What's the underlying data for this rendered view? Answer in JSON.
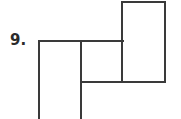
{
  "page": {
    "background_color": "#ffffff",
    "width": 181,
    "height": 119
  },
  "label": {
    "text": "9.",
    "color": "#2b2b2b"
  },
  "figure": {
    "name": "composite-rectilinear-figure",
    "stroke_color": "#3a3a3a",
    "stroke_width": 2,
    "fill_color": "#ffffff",
    "segments": [
      {
        "id": "top-horizontal",
        "x1": 39,
        "y1": 41,
        "x2": 123,
        "y2": 41
      },
      {
        "id": "left-vertical",
        "x1": 39,
        "y1": 41,
        "x2": 39,
        "y2": 119
      },
      {
        "id": "middle-vertical",
        "x1": 81,
        "y1": 41,
        "x2": 81,
        "y2": 119
      },
      {
        "id": "tall-rect-top",
        "x1": 122,
        "y1": 2,
        "x2": 165,
        "y2": 2
      },
      {
        "id": "tall-rect-left",
        "x1": 122,
        "y1": 2,
        "x2": 122,
        "y2": 82
      },
      {
        "id": "tall-rect-right",
        "x1": 165,
        "y1": 2,
        "x2": 165,
        "y2": 82
      },
      {
        "id": "bottom-horizontal",
        "x1": 81,
        "y1": 82,
        "x2": 165,
        "y2": 82
      }
    ]
  }
}
